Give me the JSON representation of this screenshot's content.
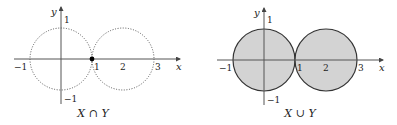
{
  "panels": [
    {
      "id": "intersection",
      "caption": {
        "left": "X",
        "op": "∩",
        "right": "Y"
      },
      "axis_labels": {
        "x": "x",
        "y": "y"
      },
      "x_ticks": [
        "−1",
        "1",
        "2",
        "3"
      ],
      "y_ticks": [
        "1",
        "−1"
      ],
      "style": "dotted circles, intersection point marked at (1,0)"
    },
    {
      "id": "union",
      "caption": {
        "left": "X",
        "op": "∪",
        "right": "Y"
      },
      "axis_labels": {
        "x": "x",
        "y": "y"
      },
      "x_ticks": [
        "−1",
        "1",
        "2",
        "3"
      ],
      "y_ticks": [
        "1",
        "−1"
      ],
      "style": "solid shaded circles"
    }
  ],
  "colors": {
    "fill": "#d3d3d3",
    "stroke": "#333333",
    "axis": "#555555"
  }
}
